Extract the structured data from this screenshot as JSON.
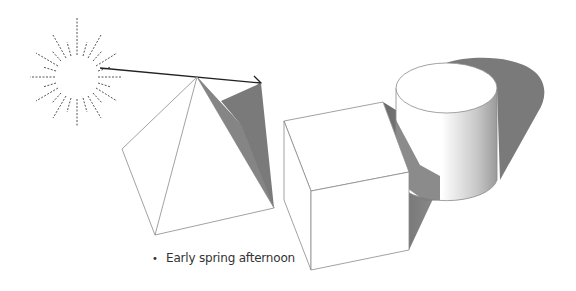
{
  "diagram": {
    "caption": "Early spring afternoon",
    "bullet": "•",
    "elements": [
      "sun",
      "light-ray-arrow",
      "pyramid",
      "pyramid-shadow",
      "cube",
      "cube-shadow",
      "cylinder",
      "cylinder-shadow"
    ],
    "colors": {
      "outline": "#8a8a8a",
      "shadow": "#7a7a7a",
      "shadow_dark": "#6e6e6e",
      "arrow": "#222222",
      "sun_rays": "#555555",
      "text": "#333333"
    }
  }
}
